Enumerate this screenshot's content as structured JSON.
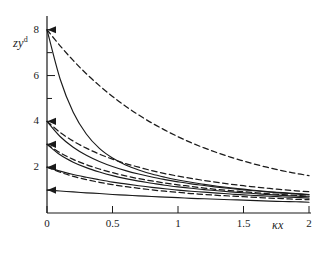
{
  "figure": {
    "background": "#ffffff",
    "ink_color": "#1a1a1a"
  },
  "axes": {
    "y_label_main": "zy",
    "y_label_sup": "d",
    "x_label": "κx",
    "x_ticks": [
      "0",
      "0.5",
      "1",
      "1.5",
      "2"
    ],
    "y_ticks": [
      "2",
      "4",
      "6",
      "8"
    ]
  },
  "chart_data": {
    "type": "line",
    "title": "",
    "xlabel": "κx",
    "ylabel": "zy^d",
    "xlim": [
      0,
      2
    ],
    "ylim": [
      0,
      8.6
    ],
    "xticks": [
      0,
      0.5,
      1,
      1.5,
      2
    ],
    "xticklabels": [
      "0",
      "0.5",
      "1",
      "1.5",
      "2"
    ],
    "yticks": [
      2,
      4,
      6,
      8
    ],
    "yticklabels": [
      "2",
      "4",
      "6",
      "8"
    ],
    "y_minor_ticks": [
      1,
      3,
      5,
      7
    ],
    "grid": false,
    "legend": null,
    "x": [
      0,
      0.1,
      0.2,
      0.3,
      0.4,
      0.5,
      0.6,
      0.7,
      0.8,
      0.9,
      1.0,
      1.1,
      1.2,
      1.3,
      1.4,
      1.5,
      1.6,
      1.7,
      1.8,
      1.9,
      2.0
    ],
    "series": [
      {
        "name": "dashed-8",
        "style": "dashed",
        "y0": 8.0,
        "values": [
          8.0,
          7.3,
          6.66,
          6.08,
          5.56,
          5.09,
          4.66,
          4.28,
          3.93,
          3.62,
          3.33,
          3.07,
          2.84,
          2.63,
          2.44,
          2.27,
          2.11,
          1.97,
          1.84,
          1.73,
          1.63
        ]
      },
      {
        "name": "solid-8",
        "style": "solid",
        "y0": 8.0,
        "values": [
          8.0,
          5.85,
          4.4,
          3.45,
          2.82,
          2.4,
          2.1,
          1.88,
          1.7,
          1.56,
          1.44,
          1.34,
          1.25,
          1.17,
          1.1,
          1.04,
          0.98,
          0.93,
          0.89,
          0.85,
          0.81
        ]
      },
      {
        "name": "dashed-4",
        "style": "dashed",
        "y0": 4.0,
        "values": [
          4.0,
          3.52,
          3.14,
          2.83,
          2.57,
          2.35,
          2.16,
          2.0,
          1.85,
          1.72,
          1.61,
          1.51,
          1.42,
          1.34,
          1.26,
          1.19,
          1.13,
          1.07,
          1.02,
          0.97,
          0.93
        ]
      },
      {
        "name": "solid-4",
        "style": "solid",
        "y0": 4.0,
        "values": [
          4.0,
          3.34,
          2.87,
          2.52,
          2.25,
          2.03,
          1.85,
          1.7,
          1.57,
          1.46,
          1.36,
          1.27,
          1.2,
          1.13,
          1.07,
          1.01,
          0.96,
          0.91,
          0.87,
          0.83,
          0.79
        ]
      },
      {
        "name": "dashed-3",
        "style": "dashed",
        "y0": 3.0,
        "values": [
          3.0,
          2.63,
          2.34,
          2.11,
          1.92,
          1.76,
          1.62,
          1.5,
          1.4,
          1.31,
          1.23,
          1.16,
          1.09,
          1.03,
          0.98,
          0.93,
          0.88,
          0.84,
          0.8,
          0.77,
          0.73
        ]
      },
      {
        "name": "solid-3",
        "style": "solid",
        "y0": 3.0,
        "values": [
          3.0,
          2.54,
          2.22,
          1.98,
          1.79,
          1.63,
          1.5,
          1.39,
          1.3,
          1.21,
          1.14,
          1.08,
          1.02,
          0.97,
          0.92,
          0.88,
          0.84,
          0.8,
          0.77,
          0.74,
          0.71
        ]
      },
      {
        "name": "dashed-2",
        "style": "dashed",
        "y0": 2.0,
        "values": [
          2.0,
          1.78,
          1.6,
          1.46,
          1.34,
          1.24,
          1.15,
          1.08,
          1.01,
          0.95,
          0.9,
          0.85,
          0.81,
          0.77,
          0.74,
          0.71,
          0.68,
          0.65,
          0.63,
          0.6,
          0.58
        ]
      },
      {
        "name": "solid-2",
        "style": "solid",
        "y0": 2.0,
        "values": [
          2.0,
          1.83,
          1.68,
          1.56,
          1.45,
          1.35,
          1.27,
          1.19,
          1.12,
          1.06,
          1.0,
          0.95,
          0.91,
          0.87,
          0.83,
          0.79,
          0.76,
          0.73,
          0.7,
          0.68,
          0.65
        ]
      },
      {
        "name": "solid-1",
        "style": "solid",
        "y0": 1.0,
        "values": [
          1.0,
          0.96,
          0.92,
          0.88,
          0.85,
          0.81,
          0.78,
          0.75,
          0.72,
          0.69,
          0.67,
          0.64,
          0.62,
          0.6,
          0.58,
          0.56,
          0.54,
          0.52,
          0.5,
          0.49,
          0.47
        ]
      }
    ]
  }
}
